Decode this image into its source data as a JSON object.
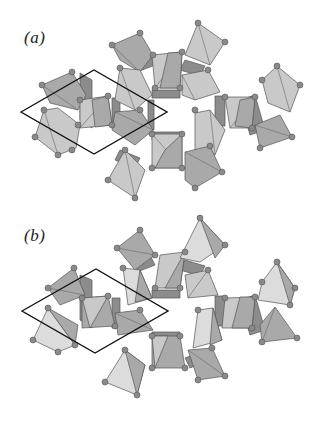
{
  "figure": {
    "panels": [
      {
        "id": "a",
        "label": "(a)",
        "unit_cell": "rhombus"
      },
      {
        "id": "b",
        "label": "(b)",
        "unit_cell": "rhombus"
      }
    ],
    "colors": {
      "polyhedron_light": "#c9c9c9",
      "polyhedron_mid": "#a9a9a9",
      "polyhedron_dark": "#8c8c8c",
      "atom": "#8a8a8a",
      "cell_outline": "#111111"
    }
  }
}
